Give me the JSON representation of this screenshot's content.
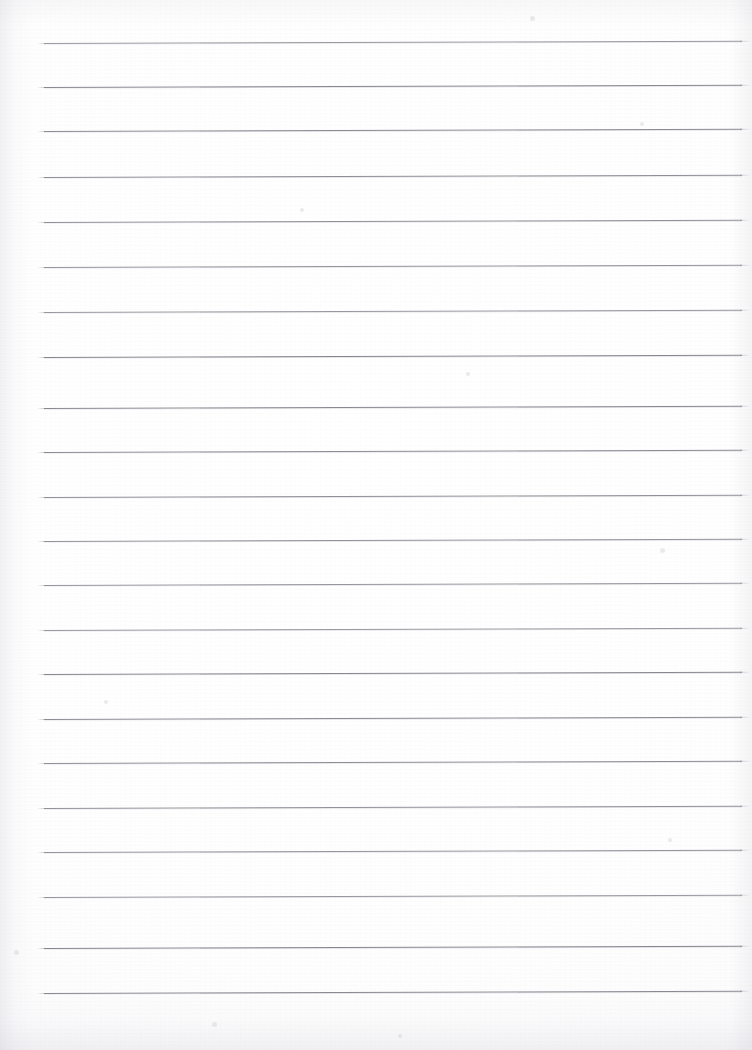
{
  "document": {
    "kind": "scanned-lined-paper",
    "title": "Blank Ruled Notepad Page",
    "page_width": 752,
    "page_height": 1050,
    "background_color": "#ffffff",
    "paper_tint": "#fdfdfe",
    "content_text": "",
    "handwriting_present": "none",
    "orientation": "portrait"
  },
  "ruling": {
    "line_color": "#83838d",
    "line_thickness_px": 1,
    "line_count": 22,
    "line_left_x": 44,
    "line_right_x": 742,
    "line_spacing_px": 44.5,
    "first_line_y": 43,
    "last_line_y": 993,
    "skew_degrees": -0.18,
    "margin_rule_present": "none",
    "y_positions": [
      43,
      87,
      131,
      177,
      222,
      267,
      312,
      357,
      408,
      452,
      497,
      541,
      585,
      630,
      674,
      719,
      763,
      808,
      852,
      897,
      948,
      993
    ]
  },
  "texture": {
    "grain": "fine-scan-grain",
    "left_edge_shadow": "#babac4",
    "right_edge_shadow": "#bcbcc6",
    "bottom_edge_shadow": "#b2b2be",
    "speckles": [
      {
        "x": 530,
        "y": 16,
        "size": 5
      },
      {
        "x": 640,
        "y": 122,
        "size": 4
      },
      {
        "x": 300,
        "y": 208,
        "size": 4
      },
      {
        "x": 466,
        "y": 372,
        "size": 4
      },
      {
        "x": 660,
        "y": 548,
        "size": 5
      },
      {
        "x": 104,
        "y": 700,
        "size": 4
      },
      {
        "x": 668,
        "y": 838,
        "size": 4
      },
      {
        "x": 14,
        "y": 950,
        "size": 5
      },
      {
        "x": 212,
        "y": 1022,
        "size": 5
      },
      {
        "x": 398,
        "y": 1034,
        "size": 4
      }
    ]
  }
}
